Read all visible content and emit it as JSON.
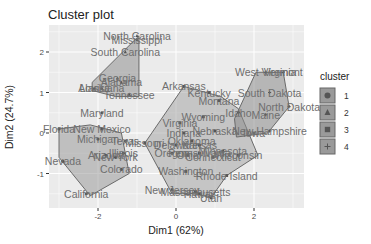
{
  "chart_data": {
    "type": "scatter",
    "title": "Cluster plot",
    "xlabel": "Dim1 (62%)",
    "ylabel": "Dim2 (24.7%)",
    "xlim": [
      -3.2,
      3.3
    ],
    "ylim": [
      -1.85,
      2.65
    ],
    "x_ticks": [
      -2,
      0,
      2
    ],
    "y_ticks": [
      -1,
      0,
      1,
      2
    ],
    "grid": true,
    "legend": {
      "title": "cluster",
      "position": "right",
      "entries": [
        "1",
        "2",
        "3",
        "4"
      ]
    },
    "clusters": [
      {
        "id": "1",
        "shape": "circle",
        "hull": [
          [
            -2.2,
            0.2
          ],
          [
            -1.4,
            0.0
          ],
          [
            -1.2,
            -1.0
          ],
          [
            -2.2,
            -1.55
          ],
          [
            -3.0,
            -0.6
          ],
          [
            -3.0,
            0.1
          ]
        ],
        "points": [
          {
            "label": "Florida",
            "x": -3.0,
            "y": 0.1
          },
          {
            "label": "New Mexico",
            "x": -1.9,
            "y": 0.1
          },
          {
            "label": "Maryland",
            "x": -1.9,
            "y": 0.5
          },
          {
            "label": "Michigan",
            "x": -2.0,
            "y": -0.15
          },
          {
            "label": "Texas",
            "x": -1.3,
            "y": -0.2
          },
          {
            "label": "Illinois",
            "x": -1.35,
            "y": -0.5
          },
          {
            "label": "New York",
            "x": -1.55,
            "y": -0.6
          },
          {
            "label": "Arizona",
            "x": -1.8,
            "y": -0.55
          },
          {
            "label": "Colorado",
            "x": -1.4,
            "y": -0.9
          },
          {
            "label": "Nevada",
            "x": -2.9,
            "y": -0.7
          },
          {
            "label": "California",
            "x": -2.3,
            "y": -1.5
          }
        ]
      },
      {
        "id": "2",
        "shape": "triangle",
        "hull": [
          [
            -0.95,
            2.4
          ],
          [
            -0.95,
            0.9
          ],
          [
            -1.55,
            0.9
          ],
          [
            -2.15,
            1.05
          ],
          [
            -2.15,
            1.25
          ]
        ],
        "points": [
          {
            "label": "North Carolina",
            "x": -1.0,
            "y": 2.4
          },
          {
            "label": "South Carolina",
            "x": -1.3,
            "y": 2.0
          },
          {
            "label": "Georgia",
            "x": -1.5,
            "y": 1.35
          },
          {
            "label": "Alaska",
            "x": -2.1,
            "y": 1.1
          },
          {
            "label": "Alabama",
            "x": -1.4,
            "y": 1.25
          },
          {
            "label": "Louisiana",
            "x": -1.9,
            "y": 1.1
          },
          {
            "label": "Tennessee",
            "x": -1.2,
            "y": 0.95
          },
          {
            "label": "Mississippi",
            "x": -1.0,
            "y": 2.3
          }
        ]
      },
      {
        "id": "3",
        "shape": "square",
        "hull": [
          [
            0.2,
            1.15
          ],
          [
            1.15,
            0.9
          ],
          [
            1.6,
            0.6
          ],
          [
            2.1,
            -0.55
          ],
          [
            1.3,
            -1.05
          ],
          [
            0.9,
            -1.6
          ],
          [
            0.5,
            -1.5
          ],
          [
            -0.1,
            -1.5
          ],
          [
            -0.8,
            -0.25
          ]
        ],
        "points": [
          {
            "label": "Arkansas",
            "x": 0.2,
            "y": 1.15
          },
          {
            "label": "Kentucky",
            "x": 0.85,
            "y": 1.0
          },
          {
            "label": "Montana",
            "x": 1.1,
            "y": 0.8
          },
          {
            "label": "Wyoming",
            "x": 0.7,
            "y": 0.4
          },
          {
            "label": "Virginia",
            "x": 0.1,
            "y": 0.25
          },
          {
            "label": "Indiana",
            "x": 0.2,
            "y": 0.0
          },
          {
            "label": "Nebraska",
            "x": 1.0,
            "y": 0.05
          },
          {
            "label": "Missouri",
            "x": -0.8,
            "y": -0.25
          },
          {
            "label": "Delaware",
            "x": 0.0,
            "y": -0.3
          },
          {
            "label": "Kansas",
            "x": 0.6,
            "y": -0.3
          },
          {
            "label": "Oklahoma",
            "x": 0.4,
            "y": -0.2
          },
          {
            "label": "Oregon",
            "x": -0.1,
            "y": -0.5
          },
          {
            "label": "Pennsylvania",
            "x": 0.6,
            "y": -0.5
          },
          {
            "label": "Ohio",
            "x": 0.3,
            "y": -0.55
          },
          {
            "label": "Wisconsin",
            "x": 1.6,
            "y": -0.55
          },
          {
            "label": "Washington",
            "x": 0.25,
            "y": -0.95
          },
          {
            "label": "Connecticut",
            "x": 0.95,
            "y": -0.6
          },
          {
            "label": "New Jersey",
            "x": -0.1,
            "y": -1.4
          },
          {
            "label": "Massachusetts",
            "x": 0.5,
            "y": -1.45
          },
          {
            "label": "Hawaii",
            "x": 0.6,
            "y": -1.5
          },
          {
            "label": "Rhode Island",
            "x": 1.3,
            "y": -1.05
          },
          {
            "label": "Utah",
            "x": 0.9,
            "y": -1.6
          },
          {
            "label": "Minnesota",
            "x": 1.2,
            "y": -0.45
          }
        ]
      },
      {
        "id": "4",
        "shape": "plus",
        "hull": [
          [
            2.05,
            1.5
          ],
          [
            2.75,
            1.5
          ],
          [
            2.9,
            0.65
          ],
          [
            2.35,
            0.0
          ],
          [
            1.55,
            -0.1
          ],
          [
            1.5,
            0.35
          ]
        ],
        "points": [
          {
            "label": "West Virginia",
            "x": 2.3,
            "y": 1.5
          },
          {
            "label": "Vermont",
            "x": 2.75,
            "y": 1.5
          },
          {
            "label": "South Dakota",
            "x": 2.4,
            "y": 1.0
          },
          {
            "label": "North Dakota",
            "x": 2.9,
            "y": 0.65
          },
          {
            "label": "Maine",
            "x": 2.3,
            "y": 0.45
          },
          {
            "label": "Idaho",
            "x": 1.6,
            "y": 0.5
          },
          {
            "label": "New Hampshire",
            "x": 2.4,
            "y": 0.05
          },
          {
            "label": "Iowa",
            "x": 2.0,
            "y": 0.0
          }
        ]
      }
    ]
  }
}
